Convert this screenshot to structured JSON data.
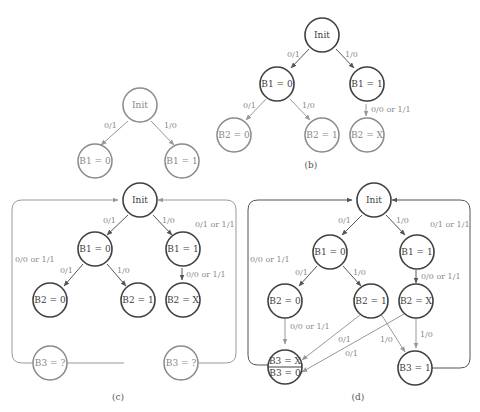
{
  "figure": {
    "panels": [
      {
        "id": "a",
        "caption": "(a)",
        "nodes": [
          {
            "id": "init",
            "label": "Init"
          },
          {
            "id": "b1_0",
            "label": "B1 = 0"
          },
          {
            "id": "b1_1",
            "label": "B1 = 1"
          }
        ],
        "edges": [
          {
            "from": "init",
            "to": "b1_0",
            "label": "0/1"
          },
          {
            "from": "init",
            "to": "b1_1",
            "label": "1/0"
          }
        ]
      },
      {
        "id": "b",
        "caption": "(b)",
        "nodes": [
          {
            "id": "init",
            "label": "Init"
          },
          {
            "id": "b1_0",
            "label": "B1 = 0"
          },
          {
            "id": "b1_1",
            "label": "B1 = 1"
          },
          {
            "id": "b2_0",
            "label": "B2 = 0"
          },
          {
            "id": "b2_1",
            "label": "B2 = 1"
          },
          {
            "id": "b2_x",
            "label": "B2 = X"
          }
        ],
        "edges": [
          {
            "from": "init",
            "to": "b1_0",
            "label": "0/1"
          },
          {
            "from": "init",
            "to": "b1_1",
            "label": "1/0"
          },
          {
            "from": "b1_0",
            "to": "b2_0",
            "label": "0/1"
          },
          {
            "from": "b1_0",
            "to": "b2_1",
            "label": "1/0"
          },
          {
            "from": "b1_1",
            "to": "b2_x",
            "label": "0/0 or 1/1"
          }
        ]
      },
      {
        "id": "c",
        "caption": "(c)",
        "nodes": [
          {
            "id": "init",
            "label": "Init"
          },
          {
            "id": "b1_0",
            "label": "B1 = 0"
          },
          {
            "id": "b1_1",
            "label": "B1 = 1"
          },
          {
            "id": "b2_0",
            "label": "B2 = 0"
          },
          {
            "id": "b2_1",
            "label": "B2 = 1"
          },
          {
            "id": "b2_x",
            "label": "B2 = X"
          },
          {
            "id": "b3_left",
            "label": "B3 = ?"
          },
          {
            "id": "b3_right",
            "label": "B3 = ?"
          }
        ],
        "edges": [
          {
            "from": "init",
            "to": "b1_0",
            "label": "0/1"
          },
          {
            "from": "init",
            "to": "b1_1",
            "label": "1/0"
          },
          {
            "from": "b1_0",
            "to": "b2_0",
            "label": "0/1"
          },
          {
            "from": "b1_0",
            "to": "b2_1",
            "label": "1/0"
          },
          {
            "from": "b1_1",
            "to": "b2_x",
            "label": "0/0 or 1/1"
          },
          {
            "from": "b3_left",
            "to": "init",
            "label": "0/0 or 1/1"
          },
          {
            "from": "b3_right",
            "to": "init",
            "label": "0/1 or 1/1"
          }
        ]
      },
      {
        "id": "d",
        "caption": "(d)",
        "nodes": [
          {
            "id": "init",
            "label": "Init"
          },
          {
            "id": "b1_0",
            "label": "B1 = 0"
          },
          {
            "id": "b1_1",
            "label": "B1 = 1"
          },
          {
            "id": "b2_0",
            "label": "B2 = 0"
          },
          {
            "id": "b2_1",
            "label": "B2 = 1"
          },
          {
            "id": "b2_x",
            "label": "B2 = X"
          },
          {
            "id": "b3_x0",
            "label_top": "B3 = X",
            "label_bottom": "B3 = 0"
          },
          {
            "id": "b3_1",
            "label": "B3 = 1"
          }
        ],
        "edges": [
          {
            "from": "init",
            "to": "b1_0",
            "label": "0/1"
          },
          {
            "from": "init",
            "to": "b1_1",
            "label": "1/0"
          },
          {
            "from": "b1_0",
            "to": "b2_0",
            "label": "0/1"
          },
          {
            "from": "b1_0",
            "to": "b2_1",
            "label": "1/0"
          },
          {
            "from": "b1_1",
            "to": "b2_x",
            "label": "0/0 or 1/1"
          },
          {
            "from": "b2_0",
            "to": "b3_x0",
            "label": "0/0 or 1/1"
          },
          {
            "from": "b2_1",
            "to": "b3_x0",
            "label": "0/1"
          },
          {
            "from": "b2_x",
            "to": "b3_x0",
            "label": "0/1"
          },
          {
            "from": "b2_1",
            "to": "b3_1",
            "label": "1/0"
          },
          {
            "from": "b2_x",
            "to": "b3_1",
            "label": "1/0"
          },
          {
            "from": "b3_x0",
            "to": "init",
            "label": "0/0 or 1/1"
          },
          {
            "from": "b3_1",
            "to": "init",
            "label": "0/1 or 1/1"
          }
        ]
      }
    ]
  }
}
